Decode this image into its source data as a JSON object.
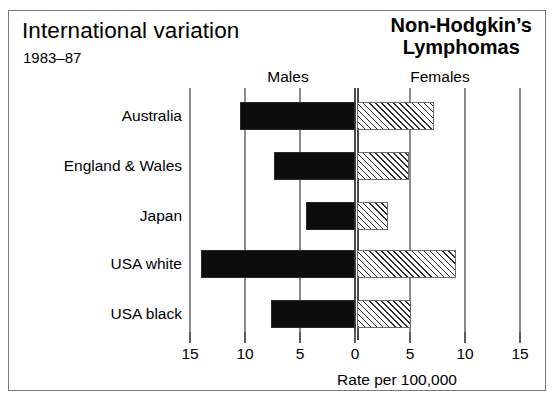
{
  "header": {
    "title": "International variation",
    "period": "1983–87",
    "disease_line1": "Non-Hodgkin’s",
    "disease_line2": "Lymphomas"
  },
  "chart_data": {
    "type": "bar",
    "orientation": "horizontal",
    "style": "bidirectional-population-pyramid",
    "title": "International variation",
    "subtitle": "1983–87",
    "annotation": "Non-Hodgkin’s Lymphomas",
    "xlabel": "Rate per 100,000",
    "ylabel": "",
    "categories": [
      "Australia",
      "England & Wales",
      "Japan",
      "USA white",
      "USA black"
    ],
    "series": [
      {
        "name": "Males",
        "side": "left",
        "fill": "solid-black",
        "color": "#0d0d0d",
        "values": [
          10.5,
          7.4,
          4.5,
          14.0,
          7.6
        ]
      },
      {
        "name": "Females",
        "side": "right",
        "fill": "diagonal-hatch",
        "color": "#ffffff",
        "values": [
          7.0,
          4.7,
          2.8,
          9.0,
          4.9
        ]
      }
    ],
    "axis": {
      "left_ticks": [
        15,
        10,
        5,
        0
      ],
      "right_ticks": [
        5,
        10,
        15
      ],
      "tick_labels": [
        "15",
        "10",
        "5",
        "0",
        "5",
        "10",
        "15"
      ],
      "max": 15,
      "grid": true,
      "zero_line": true
    },
    "legend_position": "top-inside"
  }
}
